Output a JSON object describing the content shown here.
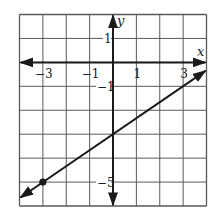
{
  "chart_data": {
    "type": "line",
    "title": "",
    "xlabel": "x",
    "ylabel": "y",
    "xlim": [
      -4,
      4
    ],
    "ylim": [
      -6,
      2
    ],
    "grid": true,
    "grid_step": 1,
    "x_ticks": [
      {
        "value": -3,
        "label": "−3"
      },
      {
        "value": -1,
        "label": "−1"
      },
      {
        "value": 1,
        "label": "1"
      },
      {
        "value": 3,
        "label": "3"
      }
    ],
    "y_ticks": [
      {
        "value": 1,
        "label": "1"
      },
      {
        "value": -1,
        "label": "−1"
      },
      {
        "value": -5,
        "label": "−5"
      }
    ],
    "series": [
      {
        "name": "line",
        "equation": "y = (2/3)x - 3",
        "slope": 0.6667,
        "intercept": -3,
        "x": [
          -4,
          -3,
          0,
          3,
          4
        ],
        "y": [
          -5.667,
          -5,
          -3,
          -1,
          -0.333
        ],
        "arrows_both_ends": true
      }
    ],
    "points": [
      {
        "x": -3,
        "y": -5,
        "label": "",
        "style": "filled-dot"
      }
    ],
    "legend": null
  },
  "colors": {
    "grid": "#5a5a5a",
    "axis": "#1a1a1a",
    "line": "#1a1a1a",
    "background": "#ffffff"
  }
}
